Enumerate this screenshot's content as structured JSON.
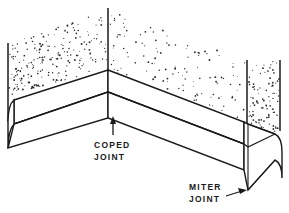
{
  "figure": {
    "name": "baseboard-corner-joints",
    "background_color": "#ffffff",
    "line_color": "#1a1a1a",
    "stipple_color": "#2b2b2b"
  },
  "callouts": [
    {
      "id": "coped-joint",
      "line1": "COPED",
      "line2": "JOINT",
      "arrow_direction": "up",
      "text_x": 94,
      "text_y": 148,
      "arrow_from_x": 113,
      "arrow_from_y": 135,
      "arrow_to_x": 113,
      "arrow_to_y": 118
    },
    {
      "id": "miter-joint",
      "line1": "MITER",
      "line2": "JOINT",
      "arrow_direction": "right",
      "text_x": 189,
      "text_y": 190,
      "arrow_from_x": 226,
      "arrow_from_y": 196,
      "arrow_to_x": 246,
      "arrow_to_y": 190
    }
  ],
  "geometry": {
    "inside_corner_vertex_x": 108,
    "inside_corner_vertex_y": 70,
    "outside_corner_vertex_x": 248,
    "outside_corner_vertex_y": 124,
    "left_wall_edge_x": 8,
    "left_wall_edge_top_y": 43,
    "corner_vertical_top_y": 8,
    "right_wall_left_edge_x": 247,
    "right_wall_right_edge_x": 280,
    "right_wall_top_y": 60,
    "baseboard_height_px": 22
  },
  "stipple": {
    "left_wall_dot_count": 210,
    "right_wall_dot_count": 120,
    "corner_wall_dot_count": 95,
    "dot_radius": 0.65
  }
}
